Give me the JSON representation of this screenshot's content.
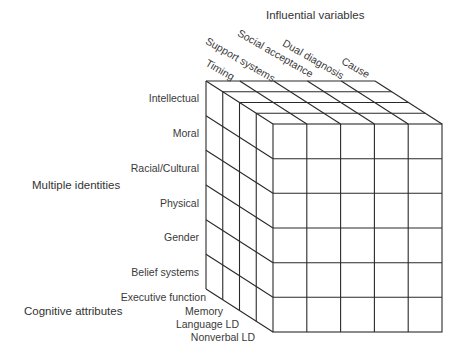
{
  "diagram": {
    "top_axis": {
      "title": "Influential variables",
      "items": [
        "Timing",
        "Support systems",
        "Social acceptance",
        "Dual diagnosis",
        "Cause"
      ]
    },
    "left_axis": {
      "title": "Multiple identities",
      "items": [
        "Intellectual",
        "Moral",
        "Racial/Cultural",
        "Physical",
        "Gender",
        "Belief systems"
      ]
    },
    "depth_axis": {
      "title": "Cognitive attributes",
      "items": [
        "Executive function",
        "Memory",
        "Language LD",
        "Nonverbal LD"
      ]
    },
    "grid": {
      "columns": 5,
      "rows": 6,
      "layers": 4
    },
    "colors": {
      "line": "#2a2a2a",
      "text": "#333333",
      "background": "#ffffff"
    }
  }
}
